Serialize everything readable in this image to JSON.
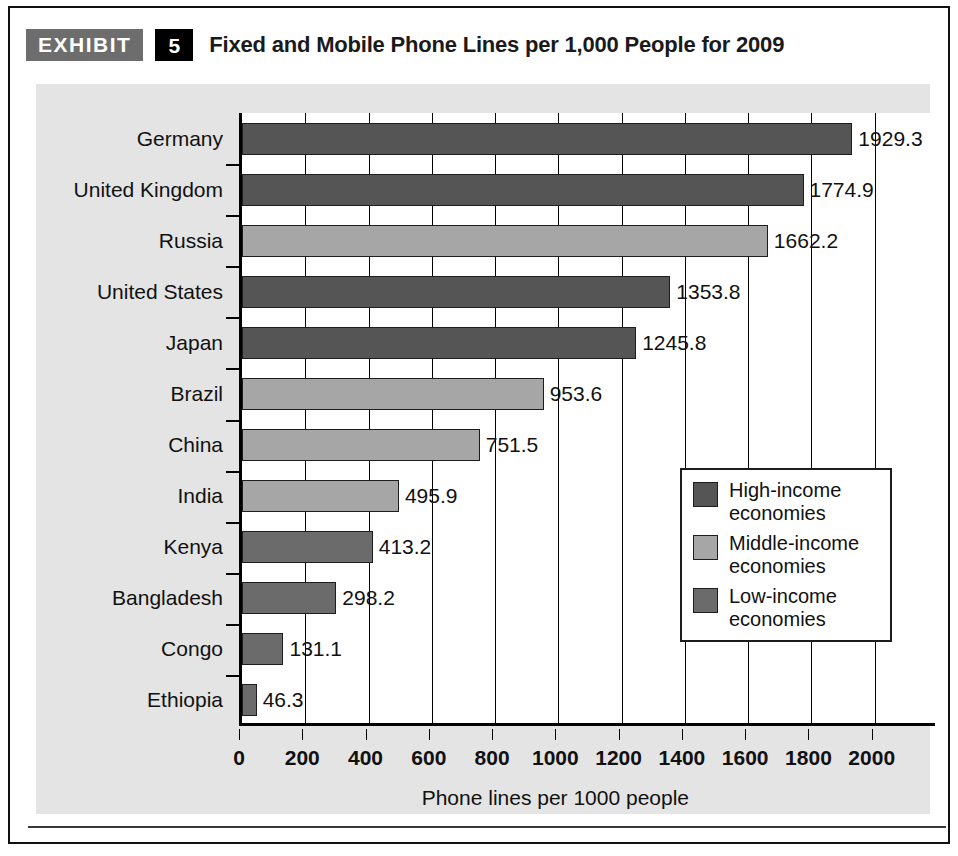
{
  "header": {
    "tag": "EXHIBIT",
    "number": "5",
    "title": "Fixed and Mobile Phone Lines per 1,000 People for 2009"
  },
  "legend": {
    "items": [
      {
        "label": "High-income\neconomies",
        "color": "#555555"
      },
      {
        "label": "Middle-income\neconomies",
        "color": "#a6a6a6"
      },
      {
        "label": "Low-income\neconomies",
        "color": "#6b6b6b"
      }
    ]
  },
  "chart_data": {
    "type": "bar",
    "orientation": "horizontal",
    "title": "Fixed and Mobile Phone Lines per 1,000 People for 2009",
    "xlabel": "Phone lines per 1000 people",
    "ylabel": "",
    "xlim": [
      0,
      2200
    ],
    "xticks": [
      0,
      200,
      400,
      600,
      800,
      1000,
      1200,
      1400,
      1600,
      1800,
      2000
    ],
    "xtick_labels": [
      "0",
      "200",
      "400",
      "600",
      "800",
      "1000",
      "1200",
      "1400",
      "1600",
      "1800",
      "2000"
    ],
    "grid": true,
    "legend_position": "center-right",
    "categories": [
      "Germany",
      "United Kingdom",
      "Russia",
      "United States",
      "Japan",
      "Brazil",
      "China",
      "India",
      "Kenya",
      "Bangladesh",
      "Congo",
      "Ethiopia"
    ],
    "values": [
      1929.3,
      1774.9,
      1662.2,
      1353.8,
      1245.8,
      953.6,
      751.5,
      495.9,
      413.2,
      298.2,
      131.1,
      46.3
    ],
    "value_labels": [
      "1929.3",
      "1774.9",
      "1662.2",
      "1353.8",
      "1245.8",
      "953.6",
      "751.5",
      "495.9",
      "413.2",
      "298.2",
      "131.1",
      "46.3"
    ],
    "groups": [
      "High-income economies",
      "High-income economies",
      "Middle-income economies",
      "High-income economies",
      "High-income economies",
      "Middle-income economies",
      "Middle-income economies",
      "Middle-income economies",
      "Low-income economies",
      "Low-income economies",
      "Low-income economies",
      "Low-income economies"
    ],
    "group_colors": {
      "High-income economies": "#555555",
      "Middle-income economies": "#a6a6a6",
      "Low-income economies": "#6b6b6b"
    }
  }
}
